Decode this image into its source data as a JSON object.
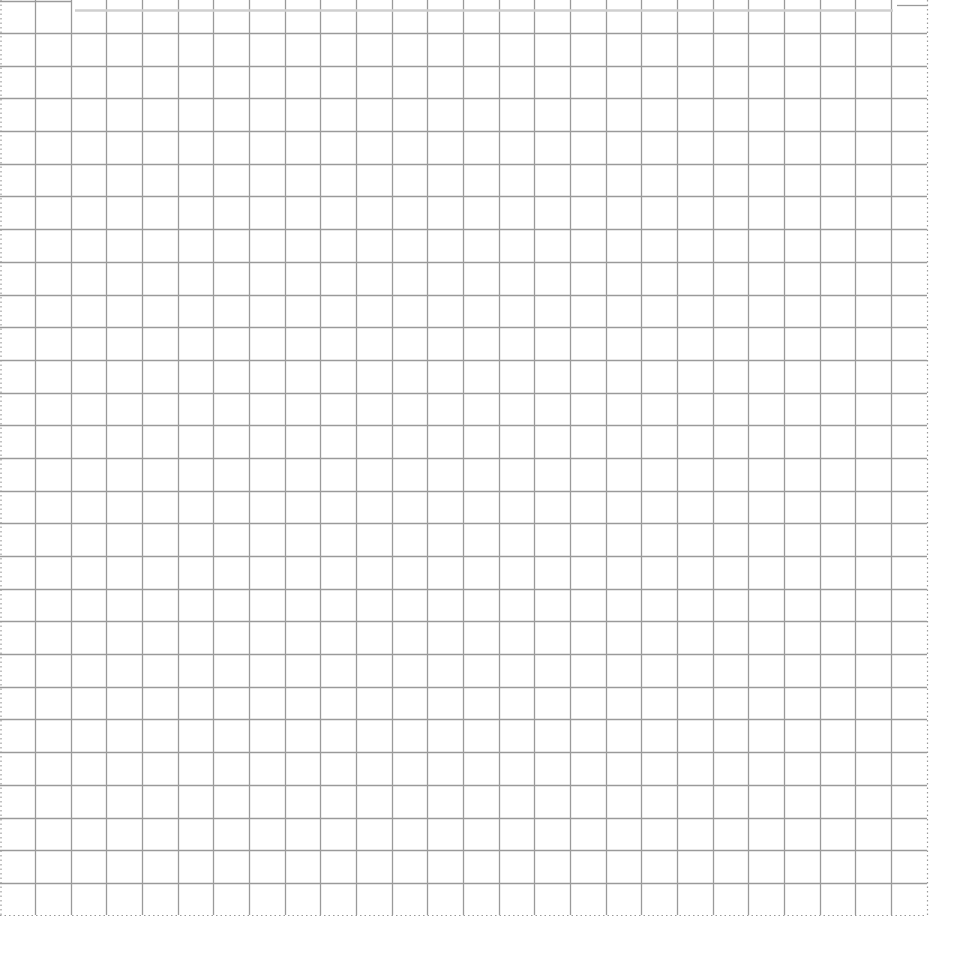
{
  "page": {
    "kind": "graph-paper-grid",
    "background_color": "#ffffff",
    "line_color": "#9a9a9a",
    "faint_line_color": "#cfcfcf"
  },
  "grid": {
    "left": 0,
    "top": 0,
    "right": 927,
    "bottom": 915,
    "first_vertical": 35,
    "vertical_spacing": 35.67,
    "vertical_count": 25,
    "first_horizontal": 33,
    "horizontal_spacing": 32.69,
    "horizontal_count": 27,
    "dotted_edges": [
      "left",
      "right",
      "bottom"
    ]
  },
  "top_marks": [
    {
      "x1": 0,
      "x2": 72,
      "y": 1,
      "style": "solid"
    },
    {
      "x1": 75,
      "x2": 893,
      "y": 10,
      "style": "faint"
    },
    {
      "x1": 897,
      "x2": 928,
      "y": 5,
      "style": "solid"
    }
  ]
}
